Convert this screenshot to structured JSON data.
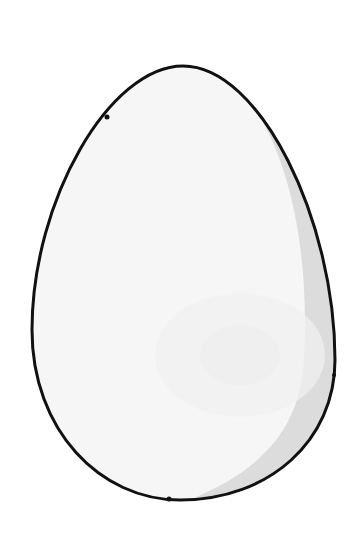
{
  "image": {
    "subject": "egg",
    "description": "White egg illustration with black outline and grey shading on right side",
    "colors": {
      "background": "#ffffff",
      "shell": "#f7f7f7",
      "shell_highlight": "#fbfbfb",
      "shadow": "#dedede",
      "outline": "#111111"
    }
  }
}
